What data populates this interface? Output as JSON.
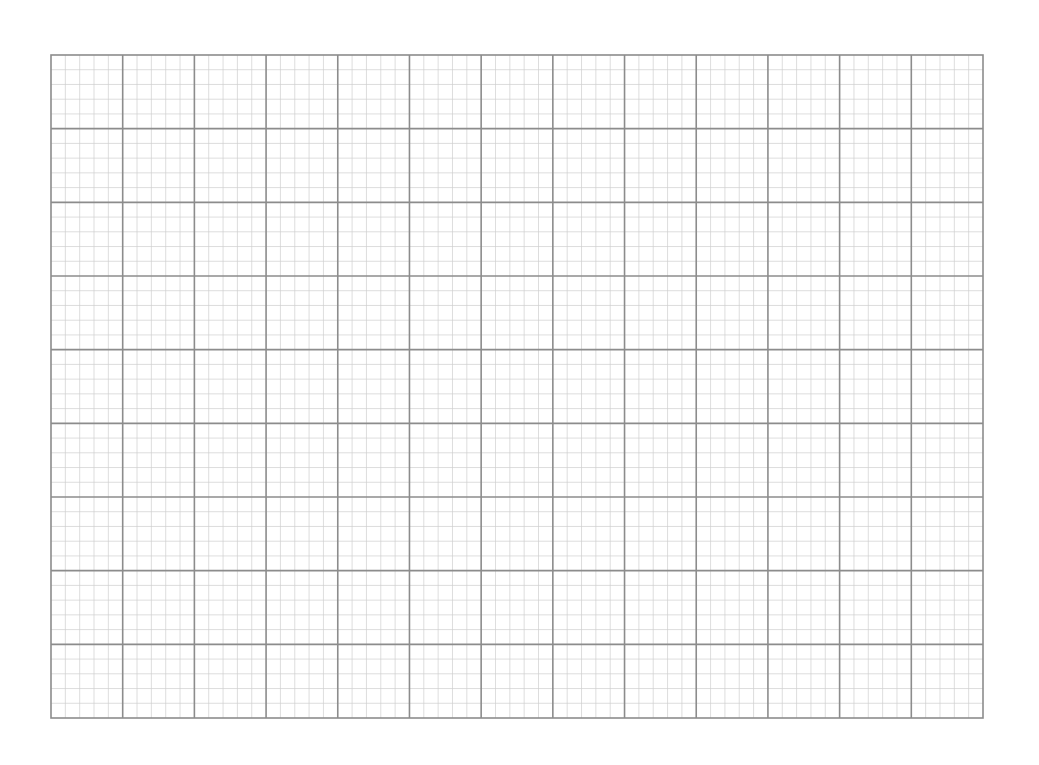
{
  "page": {
    "background": "#ffffff"
  },
  "grid": {
    "left": 50,
    "top": 54,
    "width": 932,
    "height": 663,
    "major_columns": 13,
    "major_rows": 9,
    "minor_per_major": 5,
    "major_line_color": "#8c8c8c",
    "minor_line_color": "#cfcfcf",
    "border_color": "#8c8c8c",
    "major_line_width": 1.6,
    "minor_line_width": 0.7
  }
}
